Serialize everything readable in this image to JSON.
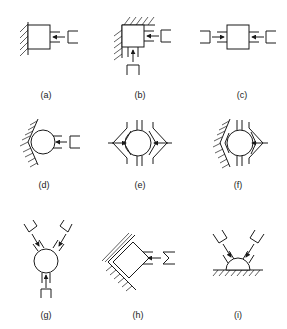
{
  "figure": {
    "panels": [
      {
        "id": "a",
        "label": "(a)",
        "description": "Block against vertical wall, one gripper from right"
      },
      {
        "id": "b",
        "label": "(b)",
        "description": "Block in corner, grippers from right and below"
      },
      {
        "id": "c",
        "label": "(c)",
        "description": "Block between two opposing grippers left and right"
      },
      {
        "id": "d",
        "label": "(d)",
        "description": "Circle in V-block wall, gripper from right"
      },
      {
        "id": "e",
        "label": "(e)",
        "description": "Circle between two V-shaped jaws left and right"
      },
      {
        "id": "f",
        "label": "(f)",
        "description": "Circle against fixed V wall, V-jaw from right"
      },
      {
        "id": "g",
        "label": "(g)",
        "description": "Circle with three grippers at 120 degrees"
      },
      {
        "id": "h",
        "label": "(h)",
        "description": "Tilted block in angled corner, gripper from right"
      },
      {
        "id": "i",
        "label": "(i)",
        "description": "Half-dome on flat surface, two angled grippers"
      }
    ]
  }
}
